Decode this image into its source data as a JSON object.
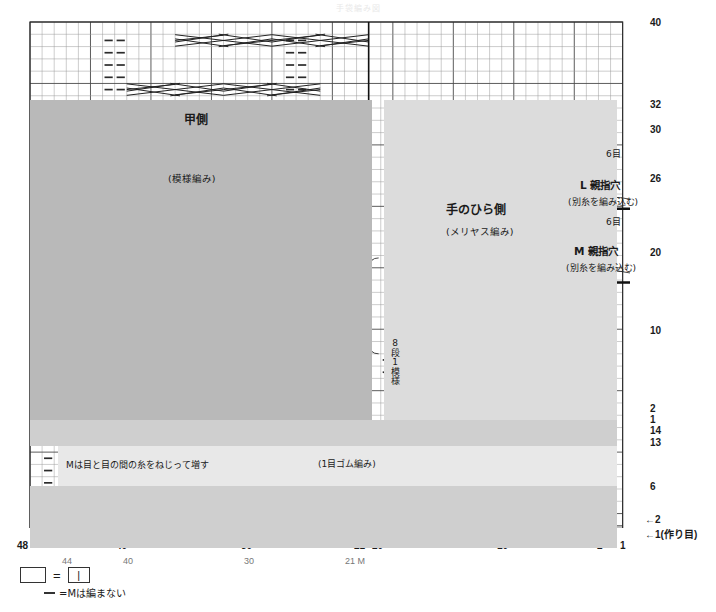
{
  "document": {
    "title": "手袋編み図",
    "type": "knitting-chart"
  },
  "chart_data": {
    "type": "table",
    "title": "手袋編み図",
    "xlabel": "目 (stitches)",
    "ylabel": "段 (rows)",
    "grid": true,
    "columns": 48,
    "rows": 40,
    "x_tick_labels": [
      "48",
      "40",
      "30",
      "21",
      "20",
      "10",
      "2",
      "1"
    ],
    "x_tick_columns": [
      48,
      40,
      30,
      21,
      20,
      10,
      2,
      1
    ],
    "x_sub_tick_labels": [
      "44",
      "40",
      "30",
      "21 M"
    ],
    "x_sub_tick_columns": [
      44,
      40,
      30,
      21
    ],
    "y_tick_labels": [
      "40",
      "32",
      "30",
      "26",
      "20",
      "10",
      "2",
      "1",
      "14",
      "13",
      "6",
      "2",
      "1(作り目)"
    ],
    "y_tick_rows": [
      40,
      32,
      30,
      26,
      20,
      10,
      2,
      1,
      14,
      13,
      6,
      2,
      1
    ],
    "legend": [
      {
        "symbol": "blank-box",
        "equals": "knit-bar",
        "text": "="
      },
      {
        "symbol": "dash",
        "text": "Mは編まない"
      }
    ],
    "regions": [
      {
        "name": "甲側",
        "sub": "(模様編み)",
        "columns": [
          21,
          48
        ],
        "rows": [
          15,
          40
        ]
      },
      {
        "name": "手のひら側",
        "sub": "(メリヤス編み)",
        "columns": [
          1,
          20
        ],
        "rows": [
          15,
          40
        ]
      },
      {
        "name": "1目ゴム編み",
        "rows": [
          1,
          14
        ]
      }
    ],
    "annotations": [
      {
        "label": "L 親指穴",
        "sub": "(別糸を編み込む)",
        "width": "6目",
        "row": 26
      },
      {
        "label": "M 親指穴",
        "sub": "(別糸を編み込む)",
        "width": "6目",
        "row": 20
      },
      {
        "label": "8段1模様",
        "orientation": "vertical"
      },
      {
        "label": "Mは目と目の間の糸をねじって増す",
        "row": 14
      }
    ]
  },
  "chart": {
    "top_title": "手袋編み図",
    "instep": {
      "label": "甲側",
      "sub": "(模様編み)"
    },
    "palm": {
      "label": "手のひら側",
      "sub": "(メリヤス編み)"
    },
    "thumb_l": {
      "width_label": "6目",
      "label": "L 親指穴",
      "sub": "(別糸を編み込む)"
    },
    "thumb_m": {
      "width_label": "6目",
      "label": "M 親指穴",
      "sub": "(別糸を編み込む)"
    },
    "repeat": {
      "label": "8段1模様"
    },
    "increase_note": "Mは目と目の間の糸をねじって増す",
    "rib_note": "(1目ゴム編み)"
  },
  "row_labels_right": {
    "r40": "40",
    "r32": "32",
    "r30": "30",
    "r26": "26",
    "r20": "20",
    "r10": "10",
    "r2": "2",
    "r1": "1",
    "r14": "14",
    "r13": "13",
    "r6": "6",
    "arrow2": "←2",
    "arrow1": "←1(作り目)"
  },
  "col_labels_bottom": {
    "c48": "48",
    "c40": "40",
    "c30": "30",
    "c21": "21",
    "c20": "20",
    "c10": "10",
    "c2": "2",
    "c1": "1"
  },
  "col_labels_sub": {
    "s44": "44",
    "s40": "40",
    "s30": "30",
    "s21": "21 M"
  },
  "legend": {
    "equals": "=",
    "knit_symbol": "|",
    "no_knit_text": "=Mは編まない"
  }
}
